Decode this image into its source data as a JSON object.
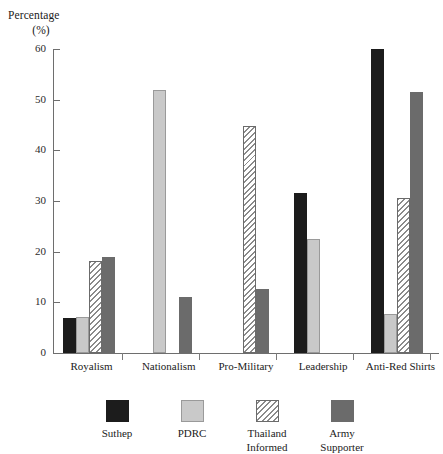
{
  "chart_data": {
    "type": "bar",
    "title": "",
    "subtitle": "",
    "xlabel": "",
    "ylabel": "Percentage",
    "ylabel_unit": "(%)",
    "ylim": [
      0,
      60
    ],
    "ytick_values": [
      0,
      10,
      20,
      30,
      40,
      50,
      60
    ],
    "ytick_labels": [
      "0",
      "10",
      "20",
      "30",
      "40",
      "50",
      "60"
    ],
    "grid": false,
    "legend_position": "bottom",
    "categories": [
      "Royalism",
      "Nationalism",
      "Pro-Military",
      "Leadership",
      "Anti-Red Shirts"
    ],
    "series": [
      {
        "name": "Suthep",
        "swatch": "suthep",
        "color": "#1c1c1c",
        "values": [
          7.0,
          0,
          0,
          31.5,
          60.0
        ]
      },
      {
        "name": "PDRC",
        "swatch": "pdrc",
        "color": "#c9c9c9",
        "values": [
          7.2,
          52.0,
          0,
          22.5,
          7.7
        ]
      },
      {
        "name": "Thailand Informed",
        "swatch": "informed",
        "color": "#ffffff",
        "values": [
          18.2,
          0,
          44.8,
          0,
          30.5
        ]
      },
      {
        "name": "Army Supporter",
        "swatch": "army",
        "color": "#6b6b6b",
        "values": [
          19.0,
          11.0,
          12.7,
          0,
          51.5
        ]
      }
    ],
    "legend_entries": [
      {
        "label_line1": "Suthep",
        "label_line2": ""
      },
      {
        "label_line1": "PDRC",
        "label_line2": ""
      },
      {
        "label_line1": "Thailand",
        "label_line2": "Informed"
      },
      {
        "label_line1": "Army",
        "label_line2": "Supporter"
      }
    ]
  }
}
